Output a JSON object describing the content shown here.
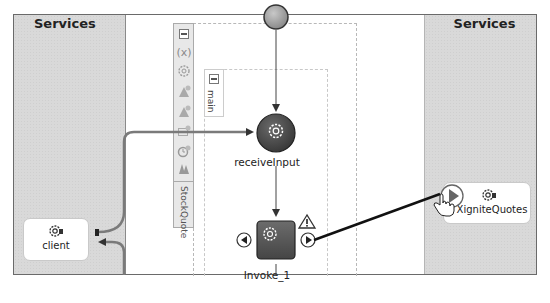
{
  "diagram": {
    "type": "BPEL process composite view",
    "left_lane": {
      "title": "Services"
    },
    "right_lane": {
      "title": "Services"
    },
    "scope": {
      "name": "StockQuote",
      "toolbar_icons": [
        "collapse-icon",
        "variables-icon",
        "gear-icon",
        "correlation-icon",
        "correlation-icon-2",
        "message-icon",
        "timer-icon",
        "handlers-icon"
      ],
      "variables_glyph": "(x)"
    },
    "sequence": {
      "name": "main"
    },
    "nodes": [
      {
        "id": "start",
        "kind": "start-event"
      },
      {
        "id": "receiveInput",
        "label": "receiveInput",
        "kind": "receive"
      },
      {
        "id": "invoke1",
        "label": "Invoke_1",
        "kind": "invoke",
        "warning": true
      }
    ],
    "services": {
      "left": [
        {
          "id": "client",
          "label": "client"
        }
      ],
      "right": [
        {
          "id": "xignite",
          "label": "XigniteQuotes"
        }
      ]
    },
    "edges": [
      {
        "from": "start",
        "to": "receiveInput"
      },
      {
        "from": "receiveInput",
        "to": "invoke1"
      },
      {
        "from": "client",
        "to": "receiveInput"
      },
      {
        "from": "receiveInput",
        "to": "client"
      },
      {
        "from": "invoke1",
        "to": "xignite",
        "state": "being-drawn"
      }
    ],
    "cursor": "hand-pointer-icon"
  }
}
